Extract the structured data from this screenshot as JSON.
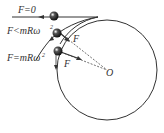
{
  "diagram": {
    "labels": {
      "f_zero": "F=0",
      "f_less": "F<mRω",
      "f_less_sup": "2",
      "f_equal": "F=mRω",
      "f_equal_sup": "2",
      "force_upper": "F",
      "force_lower": "F",
      "center": "O"
    },
    "colors": {
      "stroke": "#333333",
      "ball": "#222222",
      "background": "#ffffff"
    }
  }
}
